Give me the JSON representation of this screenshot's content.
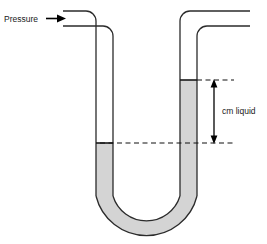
{
  "figure": {
    "labels": {
      "pressure": "Pressure",
      "measurement": "cm liquid"
    },
    "colors": {
      "outline": "#2b2b2b",
      "liquid_fill": "#d4d4d4",
      "liquid_edge": "#1a1a1a",
      "background": "#ffffff",
      "text": "#1a1a1a",
      "dashed_line": "#111111",
      "arrow": "#000000"
    },
    "geometry": {
      "left_tube": {
        "inner_x": 96,
        "outer_x": 113,
        "liquid_top_y": 143
      },
      "right_tube": {
        "inner_x": 180,
        "outer_x": 197,
        "liquid_top_y": 80
      },
      "u_bend_bottom_y": 232,
      "dashed_level_y": 143,
      "measure_arrow_x": 214,
      "measure_top_y": 80,
      "measure_bottom_y": 143
    },
    "annotations": {
      "pressure_arrow": "right-arrow-icon",
      "measure_arrow": "double-headed-vertical-arrow-icon",
      "level_reference": "dashed-reference-line"
    }
  }
}
